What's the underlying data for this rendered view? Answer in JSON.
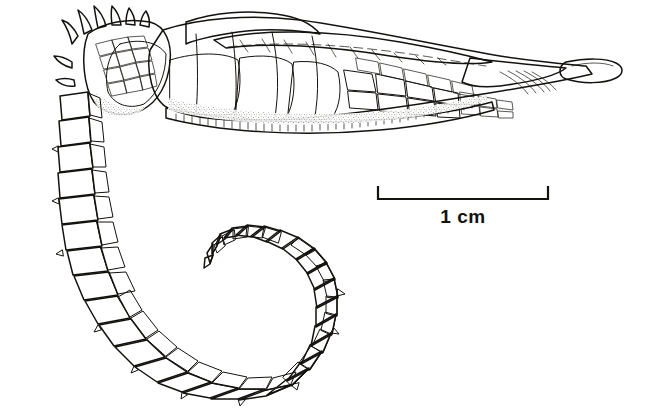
{
  "figure": {
    "kind": "scientific-line-illustration",
    "background_color": "#ffffff",
    "ink_color": "#14120f",
    "caption": "",
    "parts": [
      {
        "name": "head-coronet-spines",
        "label": "coronet"
      },
      {
        "name": "head-plates",
        "label": "head"
      },
      {
        "name": "dorsal-fin",
        "label": "dorsal fin"
      },
      {
        "name": "trunk-plates",
        "label": "trunk"
      },
      {
        "name": "snout-tip",
        "label": "snout"
      },
      {
        "name": "prehensile-tail",
        "label": "tail"
      }
    ]
  },
  "scale_bar": {
    "label": "1 cm",
    "value": 1,
    "unit": "cm",
    "x_start": 378,
    "x_end": 548,
    "y": 199,
    "tick_height": 13,
    "label_x": 463,
    "label_y": 206,
    "color": "#14120f"
  }
}
